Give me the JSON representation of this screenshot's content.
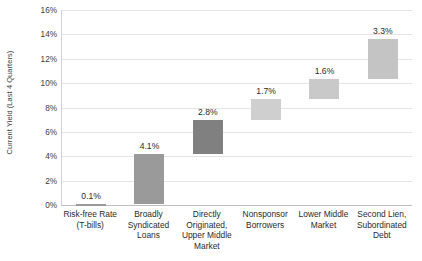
{
  "chart_data": {
    "type": "bar",
    "subtype": "waterfall",
    "title": "",
    "xlabel": "",
    "ylabel": "Current Yield (Last 4 Quarters)",
    "ylim": [
      0,
      16
    ],
    "ytick_labels": [
      "0%",
      "2%",
      "4%",
      "6%",
      "8%",
      "10%",
      "12%",
      "14%",
      "16%"
    ],
    "ytick_values": [
      0,
      2,
      4,
      6,
      8,
      10,
      12,
      14,
      16
    ],
    "grid": true,
    "legend": "none",
    "categories": [
      "Risk-free Rate (T-bills)",
      "Broadly Syndicated Loans",
      "Directly Originated, Upper Middle Market",
      "Nonsponsor Borrowers",
      "Lower Middle Market",
      "Second Lien, Subordinated Debt"
    ],
    "data_labels": [
      "0.1%",
      "4.1%",
      "2.8%",
      "1.7%",
      "1.6%",
      "3.3%"
    ],
    "values": [
      0.1,
      4.1,
      2.8,
      1.7,
      1.6,
      3.3
    ],
    "bar_base": [
      0.0,
      0.1,
      4.2,
      7.0,
      8.7,
      10.3
    ],
    "bar_top": [
      0.1,
      4.2,
      7.0,
      8.7,
      10.3,
      13.6
    ],
    "bar_colors": [
      "#9a9a9a",
      "#9a9a9a",
      "#808080",
      "#cfcfcf",
      "#c9c9c9",
      "#c4c4c4"
    ],
    "cumulative_total": 13.6
  },
  "colors": {
    "gridline": "#e4e4e4",
    "axis": "#bdbdbd",
    "text": "#2a2a2a",
    "axis_text": "#3b3b3b",
    "background": "#ffffff"
  }
}
